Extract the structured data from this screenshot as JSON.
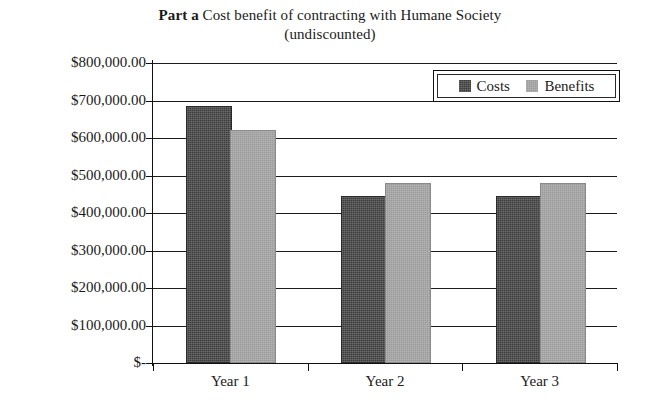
{
  "chart_data": {
    "type": "bar",
    "title_strong": "Part a",
    "title_line1": "Cost benefit of contracting with Humane Society",
    "title_line2": "(undiscounted)",
    "xlabel": "",
    "ylabel": "",
    "categories": [
      "Year 1",
      "Year 2",
      "Year 3"
    ],
    "series": [
      {
        "name": "Costs",
        "color": "#3a3a3a",
        "values": [
          680000,
          440000,
          440000
        ]
      },
      {
        "name": "Benefits",
        "color": "#9a9a9a",
        "values": [
          617000,
          475000,
          475000
        ]
      }
    ],
    "ylim": [
      0,
      800000
    ],
    "ytick_values": [
      800000,
      700000,
      600000,
      500000,
      400000,
      300000,
      200000,
      100000,
      0
    ],
    "ytick_labels": [
      "$800,000.00",
      "$700,000.00",
      "$600,000.00",
      "$500,000.00",
      "$400,000.00",
      "$300,000.00",
      "$200,000.00",
      "$100,000.00",
      "$-"
    ],
    "grid": true,
    "grid_axis": "y",
    "legend_position": "top-right-inside",
    "legend_entries": [
      "Costs",
      "Benefits"
    ]
  },
  "legend": {
    "costs_label": "Costs",
    "benefits_label": "Benefits",
    "costs_swatch": "legend-swatch-costs",
    "benefits_swatch": "legend-swatch-benefits"
  },
  "axes": {
    "x_labels": [
      "Year 1",
      "Year 2",
      "Year 3"
    ],
    "y_labels": [
      "$800,000.00",
      "$700,000.00",
      "$600,000.00",
      "$500,000.00",
      "$400,000.00",
      "$300,000.00",
      "$200,000.00",
      "$100,000.00",
      "$-"
    ]
  },
  "colors": {
    "costs": "#3a3a3a",
    "benefits": "#9a9a9a",
    "axis": "#111111",
    "background": "#ffffff"
  }
}
